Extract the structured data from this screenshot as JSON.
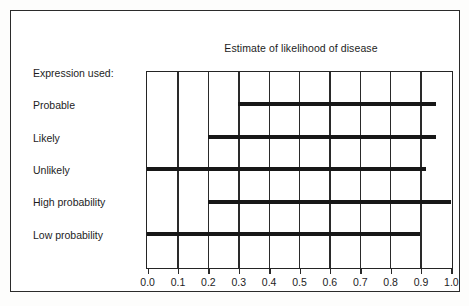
{
  "figure": {
    "title": "Estimate of likelihood of disease",
    "sidebar_label": "Expression used:"
  },
  "chart_data": {
    "type": "bar",
    "orientation": "horizontal",
    "title": "Estimate of likelihood of disease",
    "subtitle": "",
    "xlabel": "",
    "ylabel": "Expression used:",
    "xlim": [
      0.0,
      1.0
    ],
    "grid": true,
    "legend": false,
    "categories": [
      "Probable",
      "Likely",
      "Unlikely",
      "High probability",
      "Low probability"
    ],
    "xticks": [
      "0.0",
      "0.1",
      "0.2",
      "0.3",
      "0.4",
      "0.5",
      "0.6",
      "0.7",
      "0.8",
      "0.9",
      "1.0"
    ],
    "xtick_values": [
      0.0,
      0.1,
      0.2,
      0.3,
      0.4,
      0.5,
      0.6,
      0.7,
      0.8,
      0.9,
      1.0
    ],
    "ranges": [
      {
        "category": "Probable",
        "start": 0.3,
        "end": 0.95
      },
      {
        "category": "Likely",
        "start": 0.2,
        "end": 0.95
      },
      {
        "category": "Unlikely",
        "start": 0.0,
        "end": 0.92
      },
      {
        "category": "High probability",
        "start": 0.2,
        "end": 1.0
      },
      {
        "category": "Low probability",
        "start": 0.0,
        "end": 0.9
      }
    ],
    "bar_color": "#171717",
    "axis_color": "#242424"
  }
}
